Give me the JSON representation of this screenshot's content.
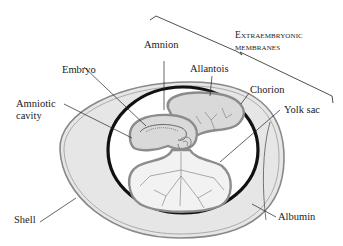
{
  "diagram": {
    "labels": {
      "amnion": "Amnion",
      "allantois": "Allantois",
      "embryo": "Embryo",
      "amniotic_cavity_1": "Amniotic",
      "amniotic_cavity_2": "cavity",
      "chorion": "Chorion",
      "yolk_sac": "Yolk sac",
      "shell": "Shell",
      "albumin": "Albumin",
      "extraembryonic_1": "Extraembryonic",
      "extraembryonic_2": "membranes"
    },
    "colors": {
      "shell_fill": "#e4e4e4",
      "shell_stroke": "#8a8a8a",
      "chorion_stroke": "#111111",
      "membrane_fill": "#d9d9d9",
      "membrane_stroke": "#8c8c8c",
      "interior_fill": "#ffffff",
      "leader_line": "#222222"
    }
  }
}
